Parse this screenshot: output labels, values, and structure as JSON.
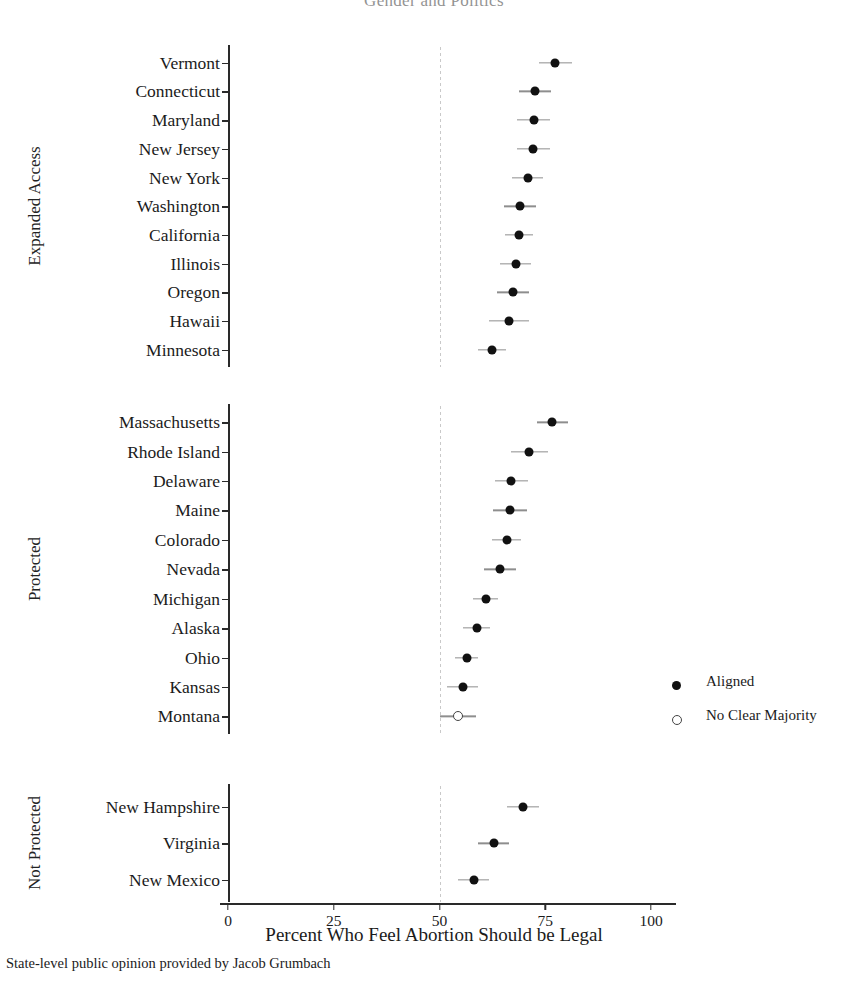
{
  "chart_data": {
    "type": "scatter",
    "title": "Gender and Politics",
    "xlabel": "Percent Who Feel Abortion Should be Legal",
    "ylabel": "",
    "caption": "State-level public opinion provided by Jacob Grumbach",
    "xlim": [
      0,
      104
    ],
    "xticks": [
      0,
      25,
      50,
      75,
      100
    ],
    "xtick_labels": [
      "0",
      "25",
      "50",
      "75",
      "100"
    ],
    "grid": false,
    "reference_line_x": 50,
    "legend_position": "right",
    "legend": [
      {
        "key": "aligned",
        "label": "Aligned",
        "marker": "filled-circle"
      },
      {
        "key": "no-clear-majority",
        "label": "No Clear Majority",
        "marker": "open-circle"
      }
    ],
    "panels": [
      {
        "label": "Expanded Access",
        "points": [
          {
            "category": "Vermont",
            "value": 77.4,
            "low": 73.6,
            "high": 81.2,
            "status": "aligned"
          },
          {
            "category": "Connecticut",
            "value": 72.6,
            "low": 68.8,
            "high": 76.4,
            "status": "aligned"
          },
          {
            "category": "Maryland",
            "value": 72.3,
            "low": 68.4,
            "high": 76.2,
            "status": "aligned"
          },
          {
            "category": "New Jersey",
            "value": 72.2,
            "low": 68.2,
            "high": 76.1,
            "status": "aligned"
          },
          {
            "category": "New York",
            "value": 70.8,
            "low": 67.1,
            "high": 74.4,
            "status": "aligned"
          },
          {
            "category": "Washington",
            "value": 69.0,
            "low": 65.2,
            "high": 72.8,
            "status": "aligned"
          },
          {
            "category": "California",
            "value": 68.7,
            "low": 65.4,
            "high": 72.0,
            "status": "aligned"
          },
          {
            "category": "Illinois",
            "value": 68.0,
            "low": 64.4,
            "high": 71.6,
            "status": "aligned"
          },
          {
            "category": "Oregon",
            "value": 67.4,
            "low": 63.6,
            "high": 71.2,
            "status": "aligned"
          },
          {
            "category": "Hawaii",
            "value": 66.5,
            "low": 61.8,
            "high": 71.2,
            "status": "aligned"
          },
          {
            "category": "Minnesota",
            "value": 62.4,
            "low": 59.2,
            "high": 65.8,
            "status": "aligned"
          }
        ]
      },
      {
        "label": "Protected",
        "points": [
          {
            "category": "Massachusetts",
            "value": 76.6,
            "low": 73.0,
            "high": 80.4,
            "status": "aligned"
          },
          {
            "category": "Rhode Island",
            "value": 71.2,
            "low": 66.8,
            "high": 75.6,
            "status": "aligned"
          },
          {
            "category": "Delaware",
            "value": 67.0,
            "low": 63.0,
            "high": 71.0,
            "status": "aligned"
          },
          {
            "category": "Maine",
            "value": 66.6,
            "low": 62.6,
            "high": 70.6,
            "status": "aligned"
          },
          {
            "category": "Colorado",
            "value": 65.9,
            "low": 62.4,
            "high": 69.2,
            "status": "aligned"
          },
          {
            "category": "Nevada",
            "value": 64.3,
            "low": 60.6,
            "high": 68.0,
            "status": "aligned"
          },
          {
            "category": "Michigan",
            "value": 61.0,
            "low": 58.0,
            "high": 63.9,
            "status": "aligned"
          },
          {
            "category": "Alaska",
            "value": 58.8,
            "low": 55.6,
            "high": 62.0,
            "status": "aligned"
          },
          {
            "category": "Ohio",
            "value": 56.4,
            "low": 53.6,
            "high": 59.2,
            "status": "aligned"
          },
          {
            "category": "Kansas",
            "value": 55.5,
            "low": 51.8,
            "high": 59.2,
            "status": "aligned"
          },
          {
            "category": "Montana",
            "value": 54.4,
            "low": 50.2,
            "high": 58.6,
            "status": "no-clear-majority"
          }
        ]
      },
      {
        "label": "Not Protected",
        "points": [
          {
            "category": "New Hampshire",
            "value": 69.8,
            "low": 66.0,
            "high": 73.6,
            "status": "aligned"
          },
          {
            "category": "Virginia",
            "value": 62.8,
            "low": 59.2,
            "high": 66.4,
            "status": "aligned"
          },
          {
            "category": "New Mexico",
            "value": 58.1,
            "low": 54.4,
            "high": 61.8,
            "status": "aligned"
          }
        ]
      }
    ]
  }
}
